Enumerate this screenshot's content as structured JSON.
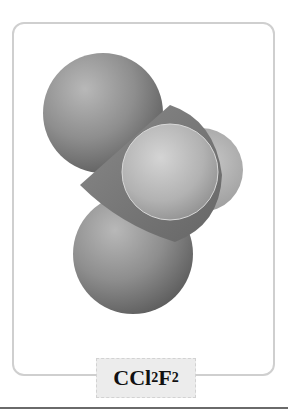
{
  "figure": {
    "molecule_name": "CCl2F2",
    "label": {
      "parts": [
        {
          "text": "CCl",
          "sub": "2"
        },
        {
          "text": "F",
          "sub": "2"
        }
      ]
    },
    "atoms": [
      {
        "element": "Cl",
        "role": "top-chlorine"
      },
      {
        "element": "Cl",
        "role": "bottom-chlorine"
      },
      {
        "element": "C",
        "role": "central-carbon"
      },
      {
        "element": "F",
        "role": "back-fluorine"
      },
      {
        "element": "F",
        "role": "front-fluorine"
      }
    ],
    "colors": {
      "chlorine": "#8c8c8c",
      "carbon": "#7a7a7a",
      "fluorine": "#b4b4b4",
      "frame_border": "#cfcfcf",
      "label_bg": "#ececec"
    }
  }
}
